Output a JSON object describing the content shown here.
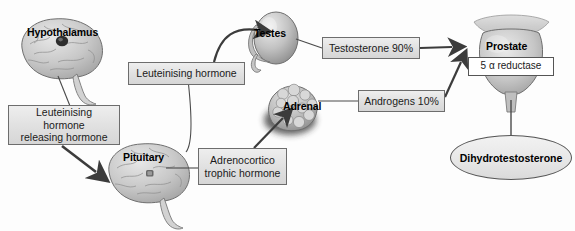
{
  "diagram": {
    "width": 575,
    "height": 231,
    "background_color": "#fdfdfd",
    "line_color": "#4a4a4a",
    "box_fill": "#e3e3e3",
    "box_border": "#6d6d6d"
  },
  "organs": [
    {
      "id": "hypothalamus",
      "label": "Hypothalamus",
      "shape": "brain"
    },
    {
      "id": "pituitary",
      "label": "Pituitary",
      "shape": "brain"
    },
    {
      "id": "testes",
      "label": "Testes",
      "shape": "testis"
    },
    {
      "id": "adrenal",
      "label": "Adrenal",
      "shape": "gland"
    },
    {
      "id": "prostate",
      "label": "Prostate",
      "shape": "prostate"
    }
  ],
  "labels": {
    "lhrh": "Leuteinising hormone\nreleasing hormone",
    "lhrh_line1": "Leuteinising hormone",
    "lhrh_line2": "releasing hormone",
    "lh": "Leuteinising hormone",
    "acth_line1": "Adrenocortico",
    "acth_line2": "trophic hormone",
    "testosterone": "Testosterone 90%",
    "androgens": "Androgens 10%",
    "reductase": "5 α reductase",
    "dht": "Dihydrotestosterone"
  },
  "flows": [
    {
      "from": "hypothalamus",
      "to": "lhrh",
      "type": "line"
    },
    {
      "from": "lhrh",
      "to": "pituitary",
      "type": "arrow"
    },
    {
      "from": "pituitary",
      "to": "lh",
      "type": "line"
    },
    {
      "from": "lh",
      "to": "testes",
      "type": "arrow"
    },
    {
      "from": "pituitary",
      "to": "acth",
      "type": "line"
    },
    {
      "from": "acth",
      "to": "adrenal",
      "type": "arrow"
    },
    {
      "from": "testes",
      "to": "testosterone",
      "type": "line"
    },
    {
      "from": "testosterone",
      "to": "prostate",
      "type": "arrow"
    },
    {
      "from": "adrenal",
      "to": "androgens",
      "type": "line"
    },
    {
      "from": "androgens",
      "to": "prostate",
      "type": "arrow"
    },
    {
      "from": "prostate",
      "to": "dht",
      "type": "line"
    }
  ]
}
